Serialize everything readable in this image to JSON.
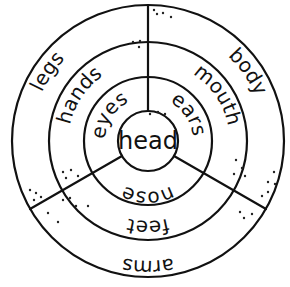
{
  "diagram": {
    "type": "concentric word wheel",
    "center": {
      "label": "head"
    },
    "rings": [
      {
        "name": "inner",
        "segments": [
          {
            "position": "upper-left",
            "label": "eyes"
          },
          {
            "position": "upper-right",
            "label": "ears"
          },
          {
            "position": "bottom",
            "label": "nose"
          }
        ]
      },
      {
        "name": "middle",
        "segments": [
          {
            "position": "upper-left",
            "label": "hands"
          },
          {
            "position": "upper-right",
            "label": "mouth"
          },
          {
            "position": "bottom",
            "label": "feet"
          }
        ]
      },
      {
        "name": "outer",
        "segments": [
          {
            "position": "upper-left",
            "label": "legs"
          },
          {
            "position": "upper-right",
            "label": "body"
          },
          {
            "position": "bottom",
            "label": "arms"
          }
        ]
      }
    ],
    "colors": {
      "line": "#111111",
      "background": "#ffffff"
    }
  }
}
